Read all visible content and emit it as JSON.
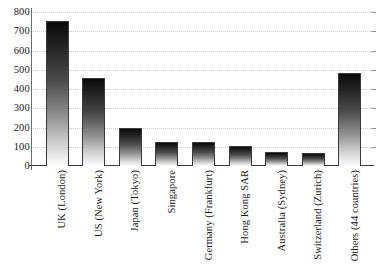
{
  "chart_data": {
    "type": "bar",
    "title": "",
    "subtitle": "",
    "xlabel": "",
    "ylabel": "",
    "ylim": [
      0,
      800
    ],
    "yticks": [
      0,
      100,
      200,
      300,
      400,
      500,
      600,
      700,
      800
    ],
    "grid": true,
    "legend": false,
    "legend_position": "none",
    "categories": [
      "UK (London)",
      "US (New York)",
      "Japan (Tokyo)",
      "Singapore",
      "Germany (Frankfurt)",
      "Hong Kong SAR",
      "Australia (Sydney)",
      "Switzerland (Zurich)",
      "Others (44 countries)"
    ],
    "values": [
      755,
      455,
      197,
      125,
      125,
      105,
      73,
      70,
      483
    ]
  }
}
